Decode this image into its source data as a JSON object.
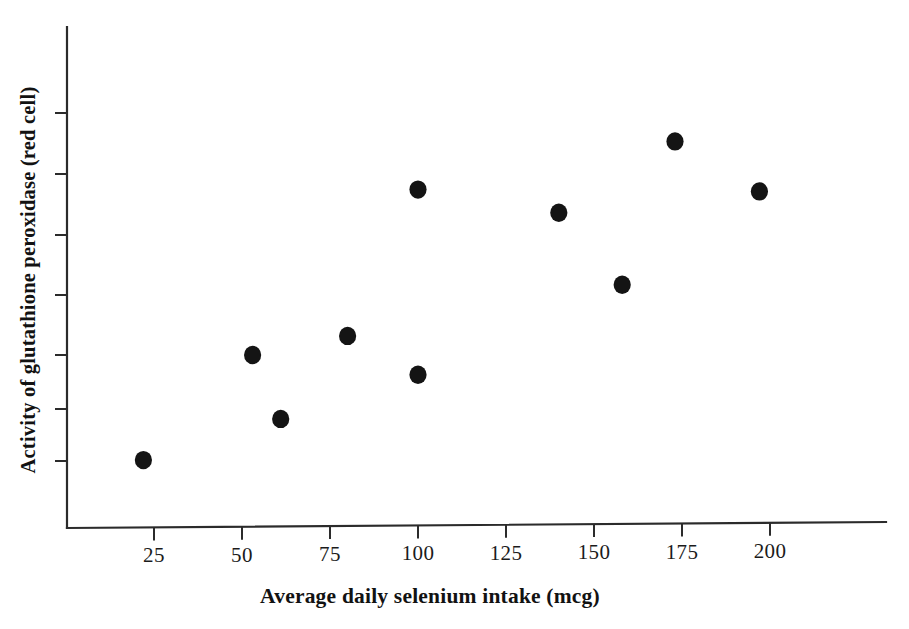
{
  "chart_data": {
    "type": "scatter",
    "title": "",
    "xlabel": "Average daily selenium intake (mcg)",
    "ylabel": "Activity of glutathione peroxidase (red cell)",
    "xlim": [
      0,
      235
    ],
    "ylim": [
      0,
      8
    ],
    "grid": false,
    "legend": null,
    "x_ticks": [
      25,
      50,
      75,
      100,
      125,
      150,
      175,
      200
    ],
    "x_tick_labels": [
      "25",
      "50",
      "75",
      "100",
      "125",
      "150",
      "175",
      "200"
    ],
    "y_ticks": [
      1,
      2,
      3,
      4,
      5,
      6,
      7
    ],
    "y_tick_labels": [
      "",
      "",
      "",
      "",
      "",
      "",
      ""
    ],
    "series": [
      {
        "name": "Subjects",
        "marker": "filled-circle",
        "color": "#141414",
        "points": [
          {
            "x": 22,
            "y": 1.17
          },
          {
            "x": 53,
            "y": 2.98
          },
          {
            "x": 61,
            "y": 1.88
          },
          {
            "x": 80,
            "y": 3.31
          },
          {
            "x": 100,
            "y": 5.83
          },
          {
            "x": 100,
            "y": 2.64
          },
          {
            "x": 140,
            "y": 5.43
          },
          {
            "x": 158,
            "y": 4.19
          },
          {
            "x": 173,
            "y": 6.66
          },
          {
            "x": 197,
            "y": 5.8
          }
        ]
      }
    ]
  },
  "figure": {
    "background_color": "#ffffff",
    "axis_color": "#2b2b2b",
    "marker_color": "#141414"
  }
}
